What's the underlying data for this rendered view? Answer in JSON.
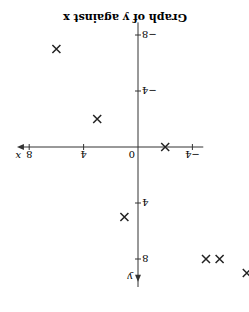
{
  "chart_data": {
    "type": "scatter",
    "title": "Graph of y against x",
    "xlabel": "x",
    "ylabel": "y",
    "xlim": [
      -8,
      9
    ],
    "ylim": [
      -9,
      10
    ],
    "xticks": [
      -4,
      4,
      8
    ],
    "yticks": [
      -8,
      -4,
      4,
      8
    ],
    "origin_label": "0",
    "marker": "x",
    "points": [
      {
        "x": -8,
        "y": 9
      },
      {
        "x": -6,
        "y": 8
      },
      {
        "x": -5,
        "y": 8
      },
      {
        "x": 1,
        "y": 5
      },
      {
        "x": -2,
        "y": 0
      },
      {
        "x": 3,
        "y": -2
      },
      {
        "x": 6,
        "y": -7
      }
    ],
    "rendered_rotation_deg": 180
  }
}
